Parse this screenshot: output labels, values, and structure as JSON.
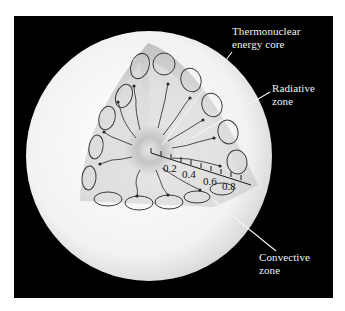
{
  "diagram": {
    "labels": {
      "core": [
        "Thermonuclear",
        "energy core"
      ],
      "radiative": [
        "Radiative",
        "zone"
      ],
      "convective": [
        "Convective",
        "zone"
      ]
    },
    "scale": {
      "ticks": [
        "0.2",
        "0.4",
        "0.6",
        "0.8"
      ]
    },
    "colors": {
      "background": "#000000",
      "sphere": "#f4f4f4",
      "cutaway": "#cfcfcf",
      "core": "#b8b8b8",
      "lines": "#3a3a3a",
      "label_text": "#f2f2f2"
    }
  }
}
